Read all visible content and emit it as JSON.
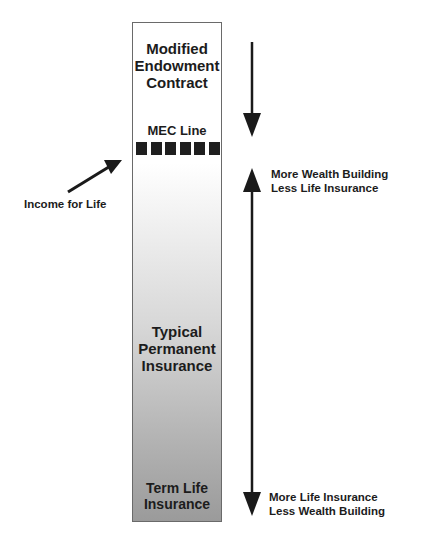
{
  "column": {
    "top_label": "Modified Endowment Contract",
    "mec_line_label": "MEC Line",
    "mec_line_segments": 6,
    "middle_label": "Typical Permanent Insurance",
    "bottom_label": "Term Life Insurance"
  },
  "left_annotation": {
    "text": "Income for Life",
    "icon": "arrow-up-right-icon"
  },
  "right_annotations": {
    "top": [
      "More Wealth Building",
      "Less Life Insurance"
    ],
    "bottom": [
      "More Life Insurance",
      "Less Wealth Building"
    ]
  },
  "colors": {
    "text": "#1c1c1c",
    "dash": "#1f1f1f",
    "gradient_top": "#ffffff",
    "gradient_bottom": "#9a9a9a",
    "arrow": "#1a1a1a"
  }
}
